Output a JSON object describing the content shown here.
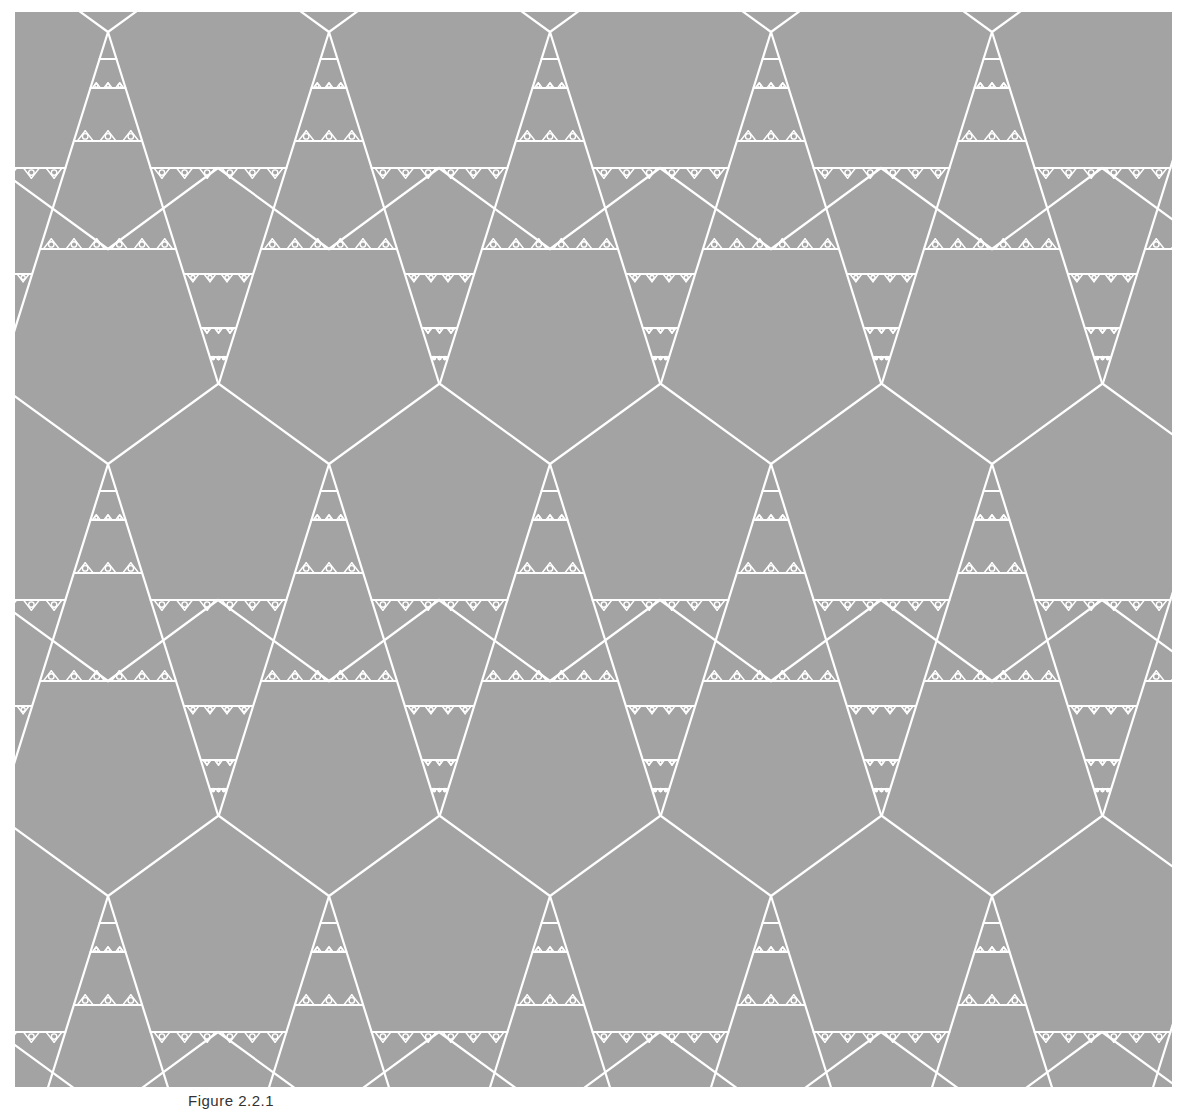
{
  "figure": {
    "caption": "Figure 2.2.1",
    "colors": {
      "background": "#a3a3a3",
      "line": "#ffffff",
      "page": "#ffffff"
    },
    "frame": {
      "x": 15,
      "y": 12,
      "width": 1157,
      "height": 1075
    },
    "lattice": {
      "period_x": 221,
      "period_y": 432,
      "origin_x": 93,
      "origin_y": 20,
      "columns": [
        -1,
        0,
        1,
        2,
        3,
        4,
        5
      ],
      "rows": [
        -1,
        0,
        1,
        2
      ]
    },
    "tile_geometry": {
      "pentagon_arm": {
        "dx": 110,
        "dy": -80
      },
      "triangle_leg": {
        "dx": 110,
        "dy": 351
      },
      "bar_upper_y": 136,
      "bar_lower_y": 217,
      "small_pentagon_top": {
        "x": 110,
        "y": 136
      },
      "inner_bars_narrow_triangle": [
        27,
        56,
        109
      ],
      "inner_bars_inverted_triangle": [
        242,
        296,
        325
      ]
    }
  }
}
